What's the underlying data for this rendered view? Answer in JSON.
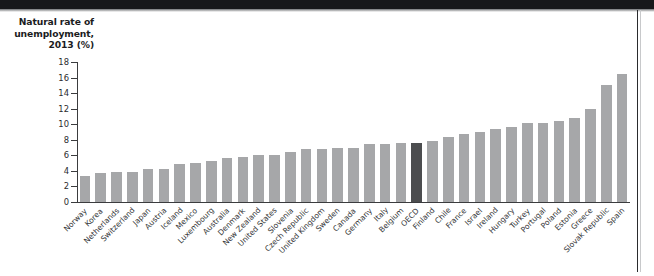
{
  "figure": {
    "axis_title": "Natural rate of\nunemployment,\n2013 (%)",
    "bar_color": "#a6a7a9",
    "highlight_color": "#4c4d4f",
    "highlight_category": "OECD",
    "axis_color": "#3b3c3e",
    "background": "#ffffff"
  },
  "chart_data": {
    "type": "bar",
    "title": "Natural rate of unemployment, 2013 (%)",
    "xlabel": "",
    "ylabel": "Natural rate of unemployment, 2013 (%)",
    "ylim": [
      0,
      18
    ],
    "yticks": [
      0,
      2,
      4,
      6,
      8,
      10,
      12,
      14,
      16,
      18
    ],
    "ytick_labels": [
      "0",
      "2",
      "4",
      "6",
      "8",
      "10",
      "12",
      "14",
      "16",
      "18"
    ],
    "grid": false,
    "legend": "none",
    "orientation": "vertical",
    "sorted": "ascending",
    "highlight": {
      "category": "OECD",
      "value": 7.6,
      "color": "#4c4d4f",
      "note": "OECD average bar shown in dark gray"
    },
    "categories": [
      "Norway",
      "Korea",
      "Netherlands",
      "Switzerland",
      "Japan",
      "Austria",
      "Iceland",
      "Mexico",
      "Luxembourg",
      "Australia",
      "Denmark",
      "New Zealand",
      "United States",
      "Slovenia",
      "Czech Republic",
      "United Kingdom",
      "Sweden",
      "Canada",
      "Germany",
      "Italy",
      "Belgium",
      "OECD",
      "Finland",
      "Chile",
      "France",
      "Israel",
      "Ireland",
      "Hungary",
      "Turkey",
      "Portugal",
      "Poland",
      "Estonia",
      "Greece",
      "Slovak Republic",
      "Spain"
    ],
    "values": [
      3.3,
      3.7,
      3.8,
      3.9,
      4.3,
      4.3,
      4.9,
      5.0,
      5.3,
      5.6,
      5.8,
      6.1,
      6.1,
      6.4,
      6.8,
      6.8,
      6.9,
      7.0,
      7.4,
      7.4,
      7.6,
      7.6,
      7.9,
      8.4,
      8.8,
      9.0,
      9.4,
      9.7,
      10.1,
      10.2,
      10.4,
      10.8,
      12.0,
      15.0,
      16.5
    ]
  }
}
